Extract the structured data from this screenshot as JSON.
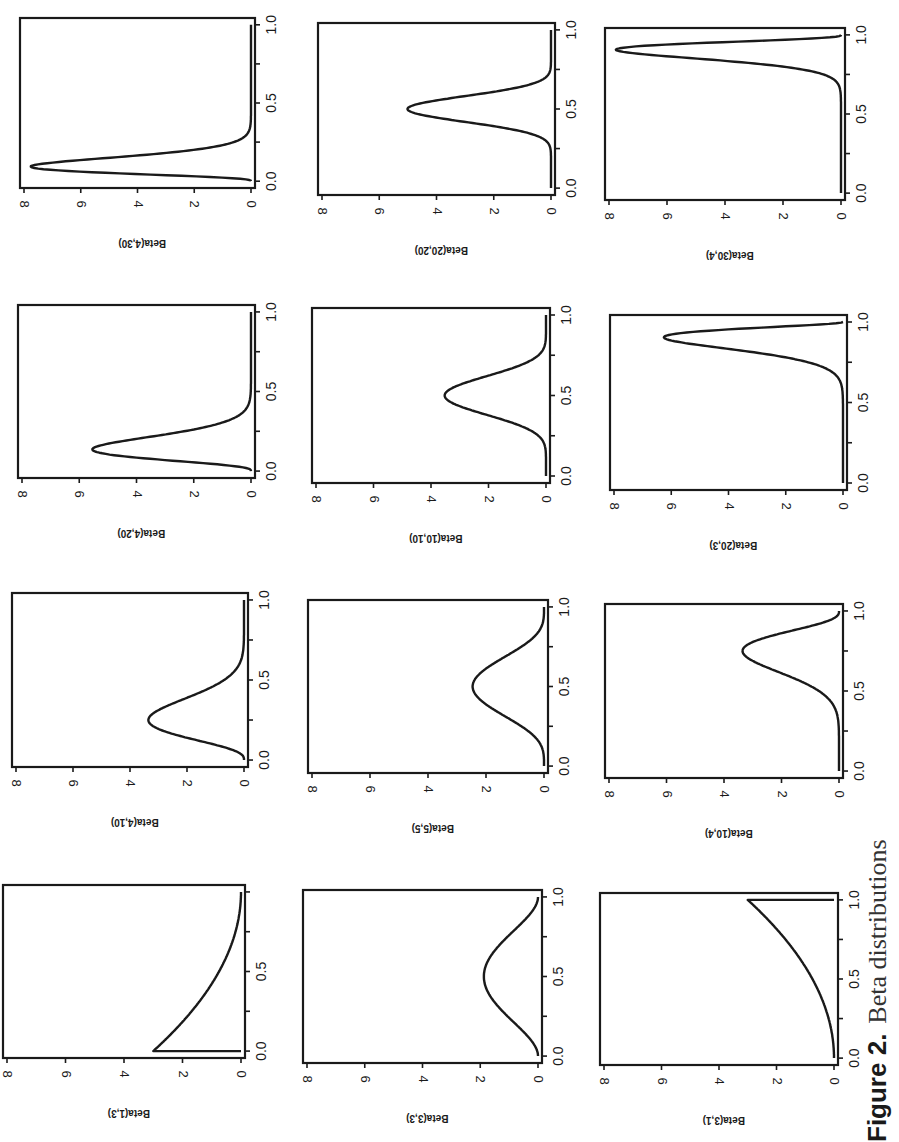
{
  "caption": {
    "label": "Figure 2.",
    "text": "Beta distributions"
  },
  "style": {
    "ink": "#1a1a1a",
    "background": "#ffffff"
  },
  "chart_data": {
    "type": "line",
    "layout": "4 rows x 3 columns grid of density plots (page printed rotated 90 degrees)",
    "shared_axes": {
      "xlabel": "",
      "x_ticks": [
        "0.0",
        "0.5",
        "1.0"
      ],
      "xlim": [
        0,
        1
      ],
      "y_ticks": [
        "0",
        "2",
        "4",
        "6",
        "8"
      ],
      "ylim": [
        0,
        8
      ],
      "grid": false
    },
    "panels": [
      {
        "ylabel": "Beta(1,3)",
        "a": 1,
        "b": 3,
        "peak_x": 0.0,
        "peak_density": 3.0,
        "x_ticks": [
          "0.0",
          "0.5"
        ]
      },
      {
        "ylabel": "Beta(4,10)",
        "a": 4,
        "b": 10,
        "peak_x": 0.25,
        "peak_density": 3.2,
        "x_ticks": [
          "0.0",
          "0.5",
          "1.0"
        ]
      },
      {
        "ylabel": "Beta(4,20)",
        "a": 4,
        "b": 20,
        "peak_x": 0.14,
        "peak_density": 5.4,
        "x_ticks": [
          "0.0",
          "0.5",
          "1.0"
        ]
      },
      {
        "ylabel": "Beta(4,30)",
        "a": 4,
        "b": 30,
        "peak_x": 0.09,
        "peak_density": 7.6,
        "x_ticks": [
          "0.0",
          "0.5",
          "1.0"
        ]
      },
      {
        "ylabel": "Beta(3,3)",
        "a": 3,
        "b": 3,
        "peak_x": 0.5,
        "peak_density": 1.9,
        "x_ticks": [
          "0.0",
          "0.5",
          "1.0"
        ]
      },
      {
        "ylabel": "Beta(5,5)",
        "a": 5,
        "b": 5,
        "peak_x": 0.5,
        "peak_density": 2.5,
        "x_ticks": [
          "0.0",
          "0.5",
          "1.0"
        ]
      },
      {
        "ylabel": "Beta(10,10)",
        "a": 10,
        "b": 10,
        "peak_x": 0.5,
        "peak_density": 3.5,
        "x_ticks": [
          "0.0",
          "0.5",
          "1.0"
        ]
      },
      {
        "ylabel": "Beta(20,20)",
        "a": 20,
        "b": 20,
        "peak_x": 0.5,
        "peak_density": 5.0,
        "x_ticks": [
          "0.0",
          "0.5",
          "1.0"
        ]
      },
      {
        "ylabel": "Beta(3,1)",
        "a": 3,
        "b": 1,
        "peak_x": 1.0,
        "peak_density": 3.0,
        "x_ticks": [
          "0.0",
          "0.5",
          "1.0"
        ]
      },
      {
        "ylabel": "Beta(10,4)",
        "a": 10,
        "b": 4,
        "peak_x": 0.75,
        "peak_density": 3.2,
        "x_ticks": [
          "0.0",
          "0.5",
          "1.0"
        ]
      },
      {
        "ylabel": "Beta(20,3)",
        "a": 20,
        "b": 3,
        "peak_x": 0.9,
        "peak_density": 5.4,
        "x_ticks": [
          "0.0",
          "0.5",
          "1.0"
        ]
      },
      {
        "ylabel": "Beta(30,4)",
        "a": 30,
        "b": 4,
        "peak_x": 0.91,
        "peak_density": 7.6,
        "x_ticks": [
          "0.0",
          "0.5",
          "1.0"
        ]
      }
    ],
    "screen_placement": [
      {
        "panel": 3,
        "box": [
          20,
          18,
          255,
          188
        ]
      },
      {
        "panel": 7,
        "box": [
          318,
          23,
          555,
          195
        ]
      },
      {
        "panel": 11,
        "box": [
          605,
          28,
          845,
          200
        ]
      },
      {
        "panel": 2,
        "box": [
          18,
          305,
          255,
          478
        ]
      },
      {
        "panel": 6,
        "box": [
          312,
          308,
          550,
          483
        ]
      },
      {
        "panel": 10,
        "box": [
          610,
          315,
          847,
          490
        ]
      },
      {
        "panel": 1,
        "box": [
          12,
          593,
          248,
          767
        ]
      },
      {
        "panel": 5,
        "box": [
          308,
          600,
          548,
          773
        ]
      },
      {
        "panel": 9,
        "box": [
          605,
          604,
          843,
          778
        ]
      },
      {
        "panel": 0,
        "box": [
          3,
          885,
          245,
          1058
        ]
      },
      {
        "panel": 4,
        "box": [
          303,
          890,
          542,
          1063
        ]
      },
      {
        "panel": 8,
        "box": [
          600,
          893,
          838,
          1065
        ]
      }
    ]
  }
}
